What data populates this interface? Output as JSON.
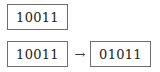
{
  "diagram": {
    "top_box": {
      "value": "10011"
    },
    "transform": {
      "from": "10011",
      "arrow": "→",
      "to": "01011"
    }
  }
}
